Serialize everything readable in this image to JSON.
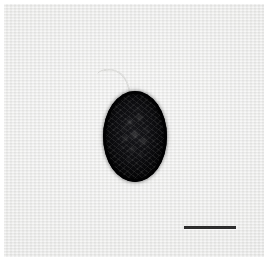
{
  "figure": {
    "domain": "Natural-Image",
    "kind": "photomicrograph",
    "width": 276,
    "height": 261,
    "has_text": false,
    "caption": "",
    "plate": {
      "background_color": "#e7e7e6",
      "margin_color": "#ffffff",
      "x": 4,
      "y": 4,
      "width": 260,
      "height": 253,
      "texture": "horizontal-scanline"
    }
  },
  "specimen": {
    "label": "",
    "shape": "ellipse",
    "color": "#0b0b0d",
    "rim_color": "#020203",
    "center_x": 135,
    "center_y": 136,
    "width": 64,
    "height": 91,
    "interior": "mottled-granular",
    "granule_color": "#8a8a86"
  },
  "filament": {
    "label": "",
    "color": "#c9c9c6",
    "origin_x": 130,
    "origin_y": 92,
    "tip_x": 104,
    "tip_y": 70
  },
  "scale_bar": {
    "label": "",
    "color": "#2c2c2c",
    "x": 184,
    "y": 226,
    "length_px": 52,
    "thickness_px": 3,
    "orientation": "horizontal"
  }
}
